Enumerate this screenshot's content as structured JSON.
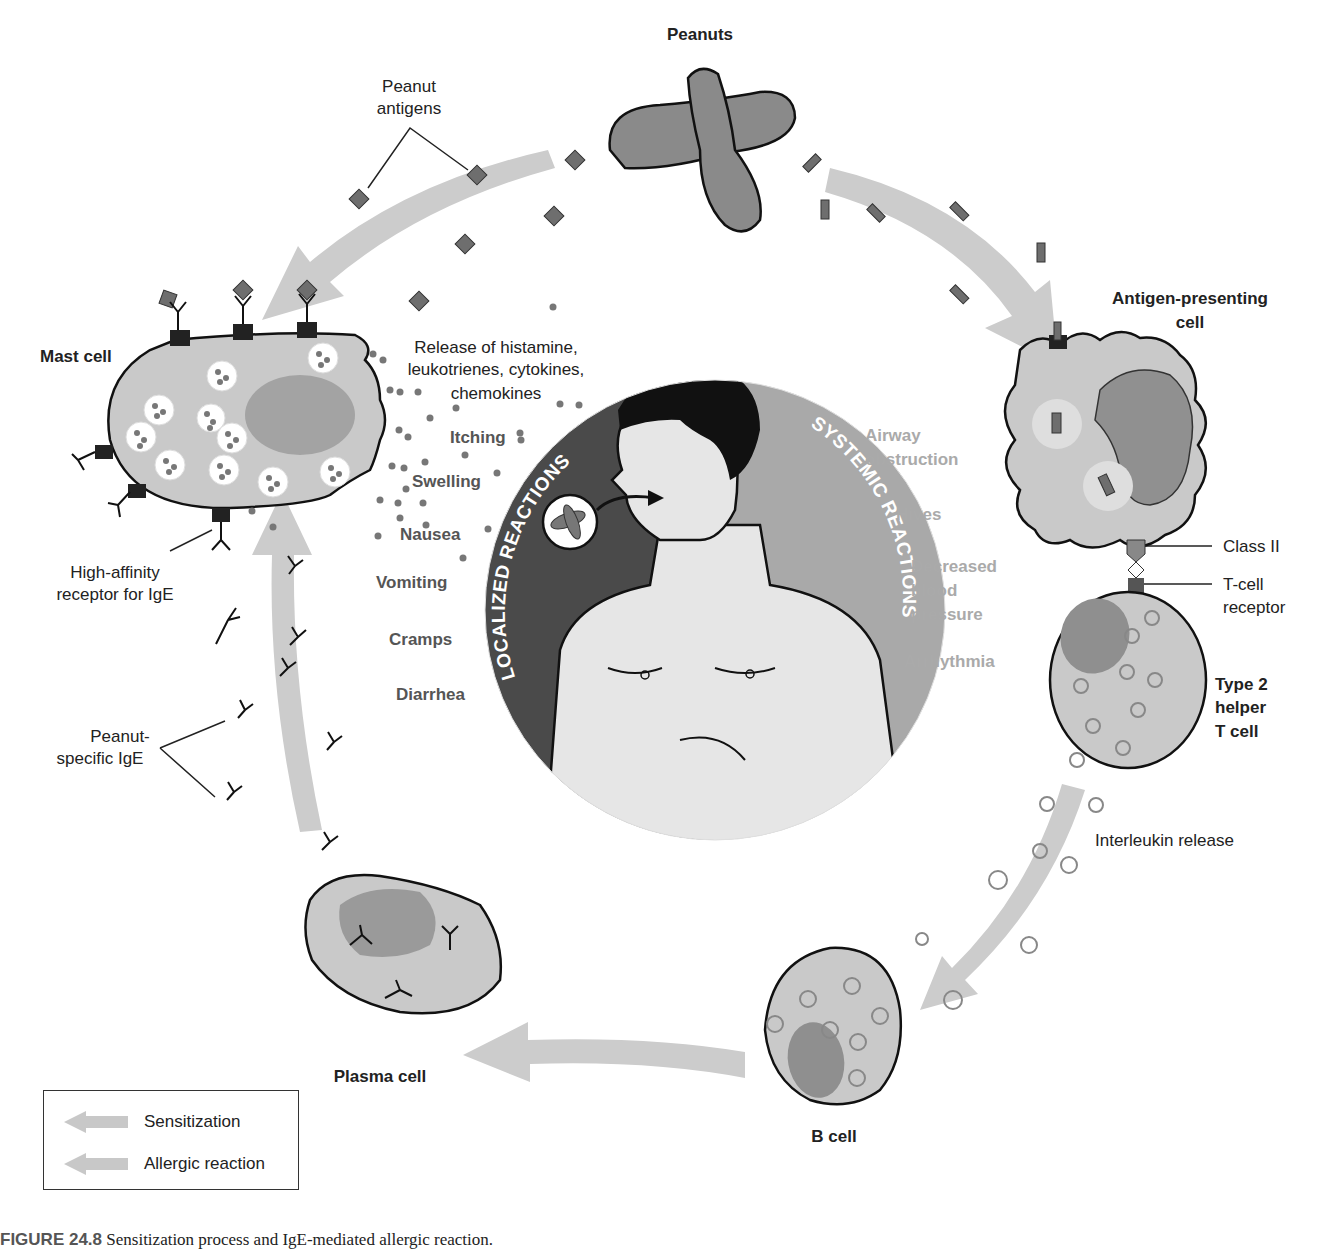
{
  "figure": {
    "caption_label": "FIGURE 24.8",
    "caption_text": "Sensitization process and IgE-mediated allergic reaction."
  },
  "labels": {
    "peanuts": "Peanuts",
    "peanut_antigens_line1": "Peanut",
    "peanut_antigens_line2": "antigens",
    "mast_cell": "Mast cell",
    "release_line1": "Release of histamine,",
    "release_line2": "leukotrienes, cytokines,",
    "release_line3": "chemokines",
    "high_affinity_line1": "High-affinity",
    "high_affinity_line2": "receptor for IgE",
    "peanut_specific_line1": "Peanut-",
    "peanut_specific_line2": "specific IgE",
    "apc_line1": "Antigen-presenting",
    "apc_line2": "cell",
    "class_ii": "Class II",
    "tcr_line1": "T-cell",
    "tcr_line2": "receptor",
    "th2_line1": "Type 2",
    "th2_line2": "helper",
    "th2_line3": "T cell",
    "interleukin": "Interleukin release",
    "b_cell": "B cell",
    "plasma_cell": "Plasma cell"
  },
  "center": {
    "localized_title": "LOCALIZED REACTIONS",
    "systemic_title": "SYSTEMIC REACTIONS",
    "localized": [
      "Itching",
      "Swelling",
      "Nausea",
      "Vomiting",
      "Cramps",
      "Diarrhea"
    ],
    "systemic": {
      "airway_line1": "Airway",
      "airway_line2": "obstruction",
      "hives": "Hives",
      "bp_line1": "Decreased",
      "bp_line2": "blood",
      "bp_line3": "pressure",
      "arrhythmia": "Arrhythmia"
    }
  },
  "legend": {
    "items": [
      {
        "label": "Sensitization",
        "color": "#c8c8c8"
      },
      {
        "label": "Allergic reaction",
        "color": "#c8c8c8"
      }
    ]
  },
  "colors": {
    "arrow": "#cccccc",
    "cell_fill": "#c9c9c9",
    "nucleus": "#9a9a9a",
    "antigen": "#6e6e6e",
    "localized_bg": "#4a4a4a",
    "systemic_bg": "#a9a9a9",
    "skin": "#e6e6e6"
  }
}
